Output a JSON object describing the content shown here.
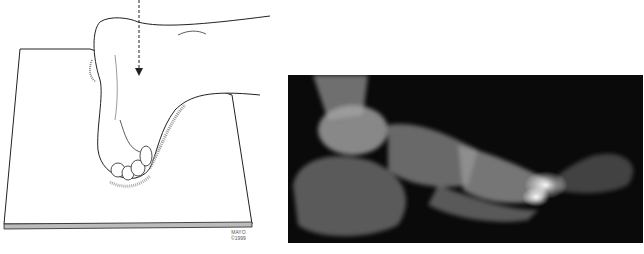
{
  "figure": {
    "left_panel": {
      "description": "Line illustration of a foot in plantar flexion resting on a flat board with a dashed arrow pointing downward",
      "credit": {
        "line1": "MAYO",
        "line2": "©1999"
      }
    },
    "right_panel": {
      "description": "Lateral radiograph of the foot showing tibia, talus, calcaneus, midfoot and metatarsals"
    },
    "colors": {
      "background": "#ffffff",
      "xray_background": "#0a0a0a",
      "line_art": "#222222"
    }
  }
}
